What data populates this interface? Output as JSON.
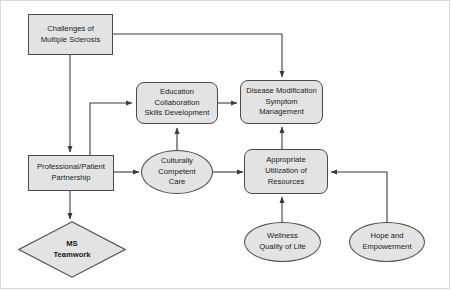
{
  "diagram": {
    "colors": {
      "node_fill": "#e3e3e3",
      "node_stroke": "#4a4a4a",
      "edge_stroke": "#3c3c3c",
      "background": "#ffffff",
      "frame": "#d8d8d8"
    },
    "nodes": [
      {
        "id": "challenges",
        "label": "Challenges of\nMultiple Sclerosis",
        "shape": "rect"
      },
      {
        "id": "education",
        "label": "Education\nCollaboration\nSkills Development",
        "shape": "round"
      },
      {
        "id": "disease",
        "label": "Disease Modification\nSymptom\nManagement",
        "shape": "round"
      },
      {
        "id": "partnership",
        "label": "Professional/Patient\nPartnership",
        "shape": "rect"
      },
      {
        "id": "culture",
        "label": "Culturally\nCompetent\nCare",
        "shape": "ellipse"
      },
      {
        "id": "resources",
        "label": "Appropriate\nUtilization of\nResources",
        "shape": "round"
      },
      {
        "id": "teamwork",
        "label": "MS\nTeamwork",
        "shape": "diamond"
      },
      {
        "id": "wellness",
        "label": "Wellness\nQuality of Life",
        "shape": "ellipse"
      },
      {
        "id": "hope",
        "label": "Hope and\nEmpowerment",
        "shape": "ellipse"
      }
    ],
    "edges": [
      {
        "from": "challenges",
        "to": "disease",
        "arrow": true
      },
      {
        "from": "challenges",
        "to": "partnership",
        "arrow": true
      },
      {
        "from": "partnership",
        "to": "education",
        "arrow": true
      },
      {
        "from": "partnership",
        "to": "culture",
        "arrow": true
      },
      {
        "from": "partnership",
        "to": "teamwork",
        "arrow": true
      },
      {
        "from": "culture",
        "to": "education",
        "arrow": true
      },
      {
        "from": "culture",
        "to": "resources",
        "arrow": true
      },
      {
        "from": "education",
        "to": "disease",
        "arrow": true
      },
      {
        "from": "resources",
        "to": "disease",
        "arrow": true
      },
      {
        "from": "wellness",
        "to": "resources",
        "arrow": true
      },
      {
        "from": "hope",
        "to": "resources",
        "arrow": true
      }
    ]
  }
}
